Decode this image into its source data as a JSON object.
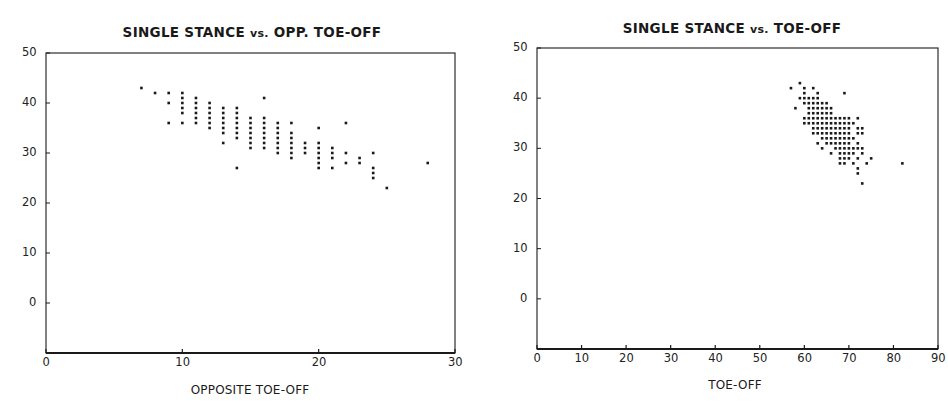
{
  "chart_data": [
    {
      "type": "scatter",
      "title": "SINGLE STANCE vs. OPP. TOE-OFF",
      "title_parts": {
        "a": "SINGLE STANCE ",
        "vs": "vs.",
        "b": " OPP. TOE-OFF"
      },
      "xlabel": "OPPOSITE TOE-OFF",
      "ylabel": "",
      "xlim": [
        0,
        30
      ],
      "ylim": [
        -10,
        50
      ],
      "xticks": [
        0,
        10,
        20,
        30
      ],
      "yticks": [
        50,
        40,
        30,
        20,
        10,
        0
      ],
      "grid": false,
      "legend": null,
      "points": [
        [
          7,
          43
        ],
        [
          8,
          42
        ],
        [
          9,
          42
        ],
        [
          9,
          40
        ],
        [
          9,
          36
        ],
        [
          10,
          42
        ],
        [
          10,
          41
        ],
        [
          10,
          40
        ],
        [
          10,
          39
        ],
        [
          10,
          38
        ],
        [
          10,
          36
        ],
        [
          11,
          41
        ],
        [
          11,
          40
        ],
        [
          11,
          39
        ],
        [
          11,
          38
        ],
        [
          11,
          37
        ],
        [
          11,
          36
        ],
        [
          12,
          40
        ],
        [
          12,
          39
        ],
        [
          12,
          38
        ],
        [
          12,
          37
        ],
        [
          12,
          36
        ],
        [
          12,
          35
        ],
        [
          13,
          39
        ],
        [
          13,
          38
        ],
        [
          13,
          37
        ],
        [
          13,
          36
        ],
        [
          13,
          35
        ],
        [
          13,
          34
        ],
        [
          13,
          32
        ],
        [
          14,
          39
        ],
        [
          14,
          38
        ],
        [
          14,
          37
        ],
        [
          14,
          36
        ],
        [
          14,
          35
        ],
        [
          14,
          34
        ],
        [
          14,
          33
        ],
        [
          14,
          27
        ],
        [
          15,
          37
        ],
        [
          15,
          36
        ],
        [
          15,
          35
        ],
        [
          15,
          34
        ],
        [
          15,
          33
        ],
        [
          15,
          32
        ],
        [
          15,
          31
        ],
        [
          16,
          41
        ],
        [
          16,
          37
        ],
        [
          16,
          36
        ],
        [
          16,
          35
        ],
        [
          16,
          34
        ],
        [
          16,
          33
        ],
        [
          16,
          32
        ],
        [
          16,
          31
        ],
        [
          17,
          36
        ],
        [
          17,
          35
        ],
        [
          17,
          34
        ],
        [
          17,
          33
        ],
        [
          17,
          32
        ],
        [
          17,
          31
        ],
        [
          17,
          30
        ],
        [
          18,
          36
        ],
        [
          18,
          34
        ],
        [
          18,
          33
        ],
        [
          18,
          32
        ],
        [
          18,
          31
        ],
        [
          18,
          30
        ],
        [
          18,
          29
        ],
        [
          19,
          32
        ],
        [
          19,
          31
        ],
        [
          19,
          30
        ],
        [
          20,
          35
        ],
        [
          20,
          32
        ],
        [
          20,
          31
        ],
        [
          20,
          30
        ],
        [
          20,
          29
        ],
        [
          20,
          28
        ],
        [
          20,
          27
        ],
        [
          21,
          31
        ],
        [
          21,
          30
        ],
        [
          21,
          29
        ],
        [
          21,
          27
        ],
        [
          22,
          36
        ],
        [
          22,
          30
        ],
        [
          22,
          28
        ],
        [
          23,
          29
        ],
        [
          23,
          28
        ],
        [
          24,
          30
        ],
        [
          24,
          27
        ],
        [
          24,
          26
        ],
        [
          24,
          25
        ],
        [
          25,
          23
        ],
        [
          28,
          28
        ]
      ]
    },
    {
      "type": "scatter",
      "title": "SINGLE STANCE vs. TOE-OFF",
      "title_parts": {
        "a": "SINGLE STANCE ",
        "vs": "vs.",
        "b": " TOE-OFF"
      },
      "xlabel": "TOE-OFF",
      "ylabel": "",
      "xlim": [
        0,
        90
      ],
      "ylim": [
        -10,
        50
      ],
      "xticks": [
        0,
        10,
        20,
        30,
        40,
        50,
        60,
        70,
        80,
        90
      ],
      "yticks": [
        50,
        40,
        30,
        20,
        10,
        0
      ],
      "grid": false,
      "legend": null,
      "rows": {
        "43": [
          59
        ],
        "42": [
          57,
          60,
          62
        ],
        "41": [
          60,
          63,
          69
        ],
        "40": [
          59,
          60,
          61,
          62,
          63
        ],
        "39": [
          60,
          61,
          62,
          63,
          64,
          65
        ],
        "38": [
          58,
          61,
          62,
          63,
          64,
          65,
          66
        ],
        "37": [
          61,
          62,
          63,
          64,
          65,
          66
        ],
        "36": [
          60,
          61,
          62,
          63,
          64,
          65,
          66,
          67,
          68,
          69,
          70,
          72
        ],
        "35": [
          60,
          61,
          62,
          63,
          64,
          65,
          66,
          67,
          68,
          69,
          70,
          71
        ],
        "34": [
          62,
          63,
          64,
          65,
          66,
          67,
          68,
          69,
          70,
          72,
          73
        ],
        "33": [
          62,
          63,
          64,
          65,
          66,
          67,
          68,
          69,
          70,
          72,
          73
        ],
        "32": [
          64,
          65,
          66,
          67,
          68,
          69,
          70,
          71
        ],
        "31": [
          63,
          65,
          66,
          67,
          68,
          69,
          70,
          72
        ],
        "30": [
          64,
          67,
          68,
          69,
          70,
          71,
          72,
          73
        ],
        "29": [
          66,
          68,
          69,
          70,
          71,
          73
        ],
        "28": [
          68,
          69,
          70,
          72,
          75
        ],
        "27": [
          68,
          69,
          71,
          74,
          82
        ],
        "26": [
          72
        ],
        "25": [
          72
        ],
        "23": [
          73
        ]
      }
    }
  ],
  "colors": {
    "ink": "#1a1a1a",
    "background": "#ffffff"
  }
}
